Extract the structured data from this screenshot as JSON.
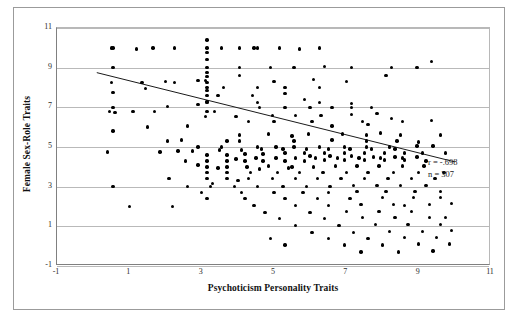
{
  "chart_data": {
    "type": "scatter",
    "title": "",
    "xlabel": "Psychoticism Personality Traits",
    "ylabel": "Female Sex-Role Traits",
    "xlim": [
      -1,
      11
    ],
    "ylim": [
      -1,
      11
    ],
    "xticks": [
      -1,
      1,
      3,
      5,
      7,
      9,
      11
    ],
    "yticks": [
      -1,
      1,
      3,
      5,
      7,
      9,
      11
    ],
    "grid": "horizontal",
    "legend": "none",
    "annotations": {
      "correlation_label": "r = -.698",
      "sample_size_label": "n = 307",
      "r": -0.698,
      "n": 307
    },
    "trendline": {
      "type": "linear",
      "x_start": 0.1,
      "y_start": 8.75,
      "x_end": 10.0,
      "y_end": 4.25
    },
    "marker": {
      "shape": "circle",
      "color": "#000000",
      "size": 3.4
    },
    "points": [
      [
        0.55,
        10.0
      ],
      [
        1.65,
        10.0
      ],
      [
        2.25,
        10.0
      ],
      [
        3.15,
        10.0
      ],
      [
        3.55,
        10.0
      ],
      [
        4.05,
        10.0
      ],
      [
        4.55,
        10.0
      ],
      [
        5.15,
        10.0
      ],
      [
        6.25,
        10.0
      ],
      [
        3.15,
        9.4
      ],
      [
        9.35,
        9.3
      ],
      [
        0.55,
        9.0
      ],
      [
        3.15,
        9.0
      ],
      [
        3.15,
        8.75
      ],
      [
        4.05,
        9.0
      ],
      [
        5.55,
        9.0
      ],
      [
        7.15,
        9.0
      ],
      [
        8.25,
        9.0
      ],
      [
        8.95,
        9.0
      ],
      [
        3.15,
        8.55
      ],
      [
        4.05,
        8.6
      ],
      [
        8.1,
        8.6
      ],
      [
        0.5,
        8.25
      ],
      [
        2.25,
        8.25
      ],
      [
        2.9,
        8.35
      ],
      [
        3.1,
        8.35
      ],
      [
        3.15,
        8.25
      ],
      [
        0.55,
        7.75
      ],
      [
        3.15,
        7.85
      ],
      [
        3.6,
        8.0
      ],
      [
        4.55,
        8.0
      ],
      [
        5.3,
        8.0
      ],
      [
        6.25,
        8.0
      ],
      [
        3.15,
        7.6
      ],
      [
        5.3,
        7.7
      ],
      [
        0.55,
        7.0
      ],
      [
        2.05,
        7.05
      ],
      [
        3.15,
        7.25
      ],
      [
        4.55,
        7.25
      ],
      [
        6.25,
        7.25
      ],
      [
        7.15,
        7.2
      ],
      [
        2.9,
        7.15
      ],
      [
        0.45,
        6.8
      ],
      [
        1.1,
        6.8
      ],
      [
        1.7,
        6.8
      ],
      [
        3.15,
        6.8
      ],
      [
        4.6,
        7.0
      ],
      [
        5.3,
        7.0
      ],
      [
        6.0,
        7.0
      ],
      [
        6.6,
        7.0
      ],
      [
        7.15,
        7.0
      ],
      [
        7.7,
        7.0
      ],
      [
        3.1,
        6.55
      ],
      [
        6.3,
        6.6
      ],
      [
        7.15,
        6.65
      ],
      [
        7.85,
        6.7
      ],
      [
        1.5,
        6.0
      ],
      [
        6.6,
        6.05
      ],
      [
        7.6,
        6.15
      ],
      [
        8.55,
        6.3
      ],
      [
        9.35,
        6.35
      ],
      [
        4.05,
        5.6
      ],
      [
        5.5,
        5.55
      ],
      [
        7.55,
        5.6
      ],
      [
        8.5,
        5.6
      ],
      [
        3.7,
        5.3
      ],
      [
        4.05,
        5.3
      ],
      [
        5.55,
        5.3
      ],
      [
        6.6,
        5.35
      ],
      [
        7.55,
        5.3
      ],
      [
        8.4,
        5.3
      ],
      [
        9.0,
        5.25
      ],
      [
        3.55,
        5.0
      ],
      [
        4.55,
        5.0
      ],
      [
        5.05,
        5.0
      ],
      [
        5.55,
        5.0
      ],
      [
        6.25,
        5.0
      ],
      [
        6.95,
        5.0
      ],
      [
        7.55,
        5.0
      ],
      [
        8.2,
        5.0
      ],
      [
        8.95,
        5.05
      ],
      [
        9.4,
        5.05
      ],
      [
        0.4,
        4.75
      ],
      [
        2.35,
        4.8
      ],
      [
        2.75,
        4.8
      ],
      [
        3.15,
        4.6
      ],
      [
        3.7,
        4.6
      ],
      [
        4.2,
        4.65
      ],
      [
        4.7,
        4.65
      ],
      [
        5.3,
        4.7
      ],
      [
        5.85,
        4.7
      ],
      [
        6.4,
        4.7
      ],
      [
        6.95,
        4.7
      ],
      [
        7.5,
        4.7
      ],
      [
        8.05,
        4.7
      ],
      [
        8.6,
        4.7
      ],
      [
        9.1,
        4.7
      ],
      [
        3.15,
        4.3
      ],
      [
        3.7,
        4.3
      ],
      [
        4.2,
        4.3
      ],
      [
        4.7,
        4.3
      ],
      [
        5.3,
        4.3
      ],
      [
        5.85,
        4.3
      ],
      [
        6.4,
        4.35
      ],
      [
        6.95,
        4.35
      ],
      [
        7.5,
        4.35
      ],
      [
        8.05,
        4.35
      ],
      [
        8.6,
        4.35
      ],
      [
        9.2,
        4.3
      ],
      [
        3.15,
        4.0
      ],
      [
        3.7,
        4.0
      ],
      [
        4.25,
        4.0
      ],
      [
        4.85,
        4.05
      ],
      [
        5.5,
        4.0
      ],
      [
        6.1,
        4.0
      ],
      [
        6.7,
        4.05
      ],
      [
        7.3,
        4.05
      ],
      [
        7.9,
        4.05
      ],
      [
        8.55,
        4.05
      ],
      [
        9.15,
        4.05
      ],
      [
        3.15,
        3.7
      ],
      [
        3.7,
        3.7
      ],
      [
        4.35,
        3.7
      ],
      [
        5.1,
        3.7
      ],
      [
        5.7,
        3.7
      ],
      [
        6.35,
        3.7
      ],
      [
        7.0,
        3.7
      ],
      [
        7.6,
        3.7
      ],
      [
        8.3,
        3.7
      ],
      [
        9.0,
        3.7
      ],
      [
        2.1,
        3.4
      ],
      [
        3.15,
        3.4
      ],
      [
        3.7,
        3.4
      ],
      [
        4.3,
        3.4
      ],
      [
        4.95,
        3.4
      ],
      [
        5.6,
        3.4
      ],
      [
        6.2,
        3.4
      ],
      [
        6.85,
        3.4
      ],
      [
        7.5,
        3.4
      ],
      [
        8.15,
        3.4
      ],
      [
        8.8,
        3.4
      ],
      [
        9.45,
        3.4
      ],
      [
        0.55,
        3.0
      ],
      [
        2.6,
        3.0
      ],
      [
        3.25,
        3.0
      ],
      [
        3.9,
        3.0
      ],
      [
        4.55,
        3.0
      ],
      [
        5.25,
        3.0
      ],
      [
        5.9,
        3.0
      ],
      [
        6.55,
        3.0
      ],
      [
        7.2,
        3.05
      ],
      [
        7.85,
        3.05
      ],
      [
        8.5,
        3.05
      ],
      [
        9.2,
        3.05
      ],
      [
        3.0,
        2.7
      ],
      [
        4.1,
        2.7
      ],
      [
        5.0,
        2.7
      ],
      [
        5.8,
        2.7
      ],
      [
        6.5,
        2.7
      ],
      [
        7.3,
        2.75
      ],
      [
        8.1,
        2.75
      ],
      [
        8.9,
        2.75
      ],
      [
        9.6,
        2.75
      ],
      [
        3.15,
        2.4
      ],
      [
        4.2,
        2.4
      ],
      [
        5.3,
        2.4
      ],
      [
        6.2,
        2.4
      ],
      [
        7.1,
        2.4
      ],
      [
        8.0,
        2.45
      ],
      [
        8.85,
        2.45
      ],
      [
        9.6,
        2.45
      ],
      [
        1.0,
        2.0
      ],
      [
        4.45,
        2.05
      ],
      [
        5.6,
        2.05
      ],
      [
        6.5,
        2.05
      ],
      [
        7.4,
        2.1
      ],
      [
        8.3,
        2.1
      ],
      [
        9.3,
        2.1
      ],
      [
        9.9,
        2.15
      ],
      [
        4.75,
        1.7
      ],
      [
        6.0,
        1.7
      ],
      [
        7.0,
        1.75
      ],
      [
        7.9,
        1.75
      ],
      [
        8.8,
        1.75
      ],
      [
        5.15,
        1.4
      ],
      [
        6.4,
        1.4
      ],
      [
        7.45,
        1.45
      ],
      [
        8.35,
        1.45
      ],
      [
        9.3,
        1.45
      ],
      [
        5.6,
        1.05
      ],
      [
        6.8,
        1.05
      ],
      [
        7.8,
        1.1
      ],
      [
        8.7,
        1.1
      ],
      [
        9.6,
        1.1
      ],
      [
        6.05,
        0.7
      ],
      [
        7.2,
        0.7
      ],
      [
        8.2,
        0.75
      ],
      [
        9.1,
        0.75
      ],
      [
        9.9,
        0.8
      ],
      [
        6.5,
        0.4
      ],
      [
        7.6,
        0.4
      ],
      [
        8.6,
        0.45
      ],
      [
        9.5,
        0.45
      ],
      [
        6.95,
        0.05
      ],
      [
        8.0,
        0.05
      ],
      [
        9.0,
        0.1
      ],
      [
        9.85,
        0.1
      ],
      [
        7.4,
        -0.3
      ],
      [
        8.45,
        -0.3
      ],
      [
        9.4,
        -0.25
      ],
      [
        2.05,
        5.3
      ],
      [
        2.45,
        5.35
      ],
      [
        1.85,
        4.75
      ],
      [
        2.55,
        4.3
      ],
      [
        3.35,
        6.8
      ],
      [
        2.9,
        5.0
      ],
      [
        4.3,
        6.3
      ],
      [
        5.0,
        6.3
      ],
      [
        4.85,
        5.65
      ],
      [
        5.95,
        5.65
      ],
      [
        6.9,
        5.65
      ],
      [
        7.95,
        5.7
      ],
      [
        3.45,
        7.6
      ],
      [
        4.4,
        7.6
      ],
      [
        5.85,
        7.4
      ],
      [
        1.35,
        8.25
      ],
      [
        2.0,
        8.3
      ],
      [
        0.5,
        10.0
      ],
      [
        1.2,
        9.95
      ],
      [
        4.9,
        9.0
      ],
      [
        6.4,
        9.05
      ],
      [
        3.15,
        9.75
      ],
      [
        3.15,
        10.4
      ],
      [
        5.0,
        8.3
      ],
      [
        6.1,
        8.4
      ],
      [
        7.0,
        8.3
      ],
      [
        2.6,
        6.05
      ],
      [
        3.95,
        6.55
      ],
      [
        4.95,
        6.6
      ],
      [
        5.6,
        6.6
      ],
      [
        6.05,
        6.3
      ],
      [
        7.45,
        6.3
      ],
      [
        8.25,
        6.45
      ],
      [
        3.3,
        3.15
      ],
      [
        4.0,
        3.3
      ],
      [
        4.6,
        3.9
      ],
      [
        5.4,
        3.95
      ],
      [
        6.0,
        4.55
      ],
      [
        6.55,
        4.55
      ],
      [
        7.15,
        4.55
      ],
      [
        7.75,
        4.5
      ],
      [
        8.35,
        4.5
      ],
      [
        8.95,
        4.5
      ],
      [
        3.5,
        4.85
      ],
      [
        4.1,
        4.85
      ],
      [
        4.65,
        4.9
      ],
      [
        5.25,
        4.9
      ],
      [
        5.9,
        4.9
      ],
      [
        6.5,
        4.9
      ],
      [
        7.1,
        4.9
      ],
      [
        7.7,
        4.9
      ],
      [
        8.35,
        4.9
      ],
      [
        2.9,
        4.1
      ],
      [
        3.45,
        3.95
      ],
      [
        3.95,
        4.4
      ],
      [
        4.5,
        4.45
      ],
      [
        5.05,
        4.45
      ],
      [
        5.6,
        4.45
      ],
      [
        6.15,
        4.45
      ],
      [
        6.75,
        4.45
      ],
      [
        7.35,
        4.45
      ],
      [
        7.95,
        4.45
      ],
      [
        8.55,
        4.45
      ],
      [
        2.2,
        2.0
      ],
      [
        1.45,
        7.95
      ],
      [
        9.7,
        3.7
      ],
      [
        9.75,
        4.7
      ],
      [
        9.6,
        5.6
      ],
      [
        0.6,
        6.75
      ],
      [
        0.55,
        5.8
      ],
      [
        4.45,
        10.0
      ],
      [
        5.7,
        9.95
      ],
      [
        3.15,
        8.0
      ],
      [
        3.15,
        7.3
      ],
      [
        8.6,
        2.05
      ],
      [
        9.75,
        1.45
      ],
      [
        5.3,
        0.05
      ],
      [
        4.9,
        0.4
      ]
    ]
  }
}
